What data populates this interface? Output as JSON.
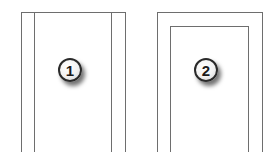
{
  "figures": [
    {
      "id": "figure-1",
      "badge": "1",
      "description": "Frame with top edge and two vertical lines on each side, open at bottom"
    },
    {
      "id": "figure-2",
      "badge": "2",
      "description": "Frame with nested inner frame, both open at bottom"
    }
  ],
  "colors": {
    "line": "#6e6e6e",
    "background": "#ffffff",
    "badge_border": "#2a2a2a"
  }
}
